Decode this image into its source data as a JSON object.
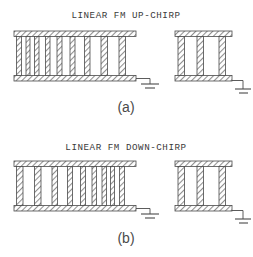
{
  "figure": {
    "kind": "technical-line-drawing",
    "background_color": "#ffffff",
    "ink_color": "#4a4a4a",
    "hatch_color": "#8a8a8a",
    "panels": [
      {
        "id": "a",
        "title": "LINEAR FM UP-CHIRP",
        "caption": "(a)",
        "title_x": 126,
        "title_y": 18,
        "caption_x": 126,
        "caption_y": 108,
        "transducers": [
          {
            "name": "chirp-idt-left",
            "role": "long chirp transducer",
            "x": 14,
            "y": 31,
            "width": 122,
            "height": 50,
            "busbar_thickness": 5.5,
            "finger_count": 9,
            "note": "finger pitch increases left to right (up-chirp)",
            "fingers": [
              {
                "x": 16.5,
                "w": 5.0,
                "from": "bottom"
              },
              {
                "x": 26.0,
                "w": 4.0,
                "from": "top"
              },
              {
                "x": 34.5,
                "w": 4.5,
                "from": "bottom"
              },
              {
                "x": 45.5,
                "w": 4.5,
                "from": "top"
              },
              {
                "x": 57.0,
                "w": 5.0,
                "from": "bottom"
              },
              {
                "x": 70.0,
                "w": 5.0,
                "from": "top"
              },
              {
                "x": 84.5,
                "w": 5.5,
                "from": "bottom"
              },
              {
                "x": 101.0,
                "w": 6.5,
                "from": "top"
              },
              {
                "x": 119.0,
                "w": 6.5,
                "from": "bottom"
              }
            ]
          },
          {
            "name": "short-idt-right",
            "role": "short wideband transducer",
            "x": 175,
            "y": 31,
            "width": 57,
            "height": 50,
            "busbar_thickness": 5.5,
            "finger_count": 3,
            "fingers": [
              {
                "x": 178.0,
                "w": 6.5,
                "from": "bottom"
              },
              {
                "x": 197.0,
                "w": 6.5,
                "from": "top"
              },
              {
                "x": 219.0,
                "w": 6.5,
                "from": "bottom"
              }
            ]
          }
        ],
        "grounds": [
          {
            "name": "ground-symbol-left",
            "wire_from_x": 136,
            "wire_y": 79,
            "stem_x": 150,
            "stem_bottom": 90
          },
          {
            "name": "ground-symbol-right",
            "wire_from_x": 232,
            "wire_y": 81,
            "stem_x": 243,
            "stem_bottom": 95
          }
        ]
      },
      {
        "id": "b",
        "title": "LINEAR FM DOWN-CHIRP",
        "caption": "(b)",
        "title_x": 126,
        "title_y": 150,
        "caption_x": 126,
        "caption_y": 240,
        "transducers": [
          {
            "name": "chirp-idt-left",
            "role": "long chirp transducer",
            "x": 14,
            "y": 161,
            "width": 122,
            "height": 50,
            "busbar_thickness": 5.5,
            "finger_count": 9,
            "note": "finger pitch decreases left to right (down-chirp)",
            "fingers": [
              {
                "x": 16.5,
                "w": 6.5,
                "from": "bottom"
              },
              {
                "x": 34.5,
                "w": 6.5,
                "from": "top"
              },
              {
                "x": 52.0,
                "w": 5.5,
                "from": "bottom"
              },
              {
                "x": 67.5,
                "w": 5.0,
                "from": "top"
              },
              {
                "x": 80.5,
                "w": 5.0,
                "from": "bottom"
              },
              {
                "x": 92.0,
                "w": 4.5,
                "from": "top"
              },
              {
                "x": 102.0,
                "w": 4.5,
                "from": "bottom"
              },
              {
                "x": 110.5,
                "w": 4.0,
                "from": "top"
              },
              {
                "x": 119.5,
                "w": 5.0,
                "from": "bottom"
              }
            ]
          },
          {
            "name": "short-idt-right",
            "role": "short wideband transducer",
            "x": 175,
            "y": 161,
            "width": 57,
            "height": 50,
            "busbar_thickness": 5.5,
            "finger_count": 3,
            "fingers": [
              {
                "x": 178.0,
                "w": 6.5,
                "from": "bottom"
              },
              {
                "x": 197.0,
                "w": 6.5,
                "from": "top"
              },
              {
                "x": 219.0,
                "w": 6.5,
                "from": "bottom"
              }
            ]
          }
        ],
        "grounds": [
          {
            "name": "ground-symbol-left",
            "wire_from_x": 136,
            "wire_y": 209,
            "stem_x": 150,
            "stem_bottom": 220
          },
          {
            "name": "ground-symbol-right",
            "wire_from_x": 232,
            "wire_y": 211,
            "stem_x": 243,
            "stem_bottom": 225
          }
        ]
      }
    ]
  }
}
